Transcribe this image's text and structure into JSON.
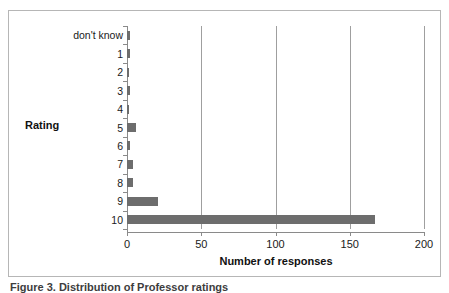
{
  "figure": {
    "caption": "Figure 3.  Distribution of Professor ratings",
    "caption_note": "partially cropped at bottom edge"
  },
  "axis_titles": {
    "x": "Number of responses",
    "y": "Rating"
  },
  "chart_data": {
    "type": "bar",
    "orientation": "horizontal",
    "title": "",
    "xlabel": "Number of responses",
    "ylabel": "Rating",
    "categories": [
      "don't know",
      "1",
      "2",
      "3",
      "4",
      "5",
      "6",
      "7",
      "8",
      "9",
      "10"
    ],
    "values": [
      2,
      2,
      1,
      2,
      1,
      6,
      2,
      4,
      4,
      21,
      167
    ],
    "xlim": [
      0,
      200
    ],
    "ylim": null,
    "xticks": [
      0,
      50,
      100,
      150,
      200
    ],
    "xticklabels": [
      "0",
      "50",
      "100",
      "150",
      "200"
    ],
    "grid": "vertical gridlines at x = 50, 100, 150, 200",
    "legend": "none",
    "series": [
      {
        "name": "Number of responses",
        "color": "#6d6d6d",
        "values": [
          2,
          2,
          1,
          2,
          1,
          6,
          2,
          4,
          4,
          21,
          167
        ]
      }
    ]
  },
  "colors": {
    "bar": "#6d6d6d",
    "gridline": "#9f9f9f",
    "axis": "#8a8a8a",
    "frame": "#b6b6b6",
    "background": "#ffffff",
    "text": "#1a1a1a"
  }
}
